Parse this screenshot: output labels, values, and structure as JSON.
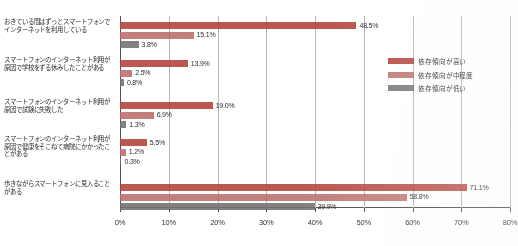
{
  "chart_data": {
    "type": "bar",
    "orientation": "horizontal",
    "title": "",
    "xlabel": "",
    "ylabel": "",
    "xlim": [
      0,
      80
    ],
    "xtick_labels": [
      "0%",
      "10%",
      "20%",
      "30%",
      "40%",
      "50%",
      "60%",
      "70%",
      "80%"
    ],
    "xticks": [
      0,
      10,
      20,
      30,
      40,
      50,
      60,
      70,
      80
    ],
    "grid": true,
    "legend_position": "right",
    "categories": [
      "おきている間はずっとスマートフォンでインターネットを利用している",
      "スマートフォンのインターネット利用が原因で学校をずる休みしたことがある",
      "スマートフォンのインターネット利用が原因で試験に失敗した",
      "スマートフォンのインターネット利用が原因で健康をそこねて病院にかかったことがある",
      "歩きながらスマートフォンに見入ることがある"
    ],
    "series": [
      {
        "name": "依存傾向が高い",
        "color": "#b03a32",
        "values": [
          48.5,
          13.9,
          19.0,
          5.5,
          71.1
        ],
        "labels": [
          "48.5%",
          "13.9%",
          "19.0%",
          "5.5%",
          "71.1%"
        ]
      },
      {
        "name": "依存傾向が中程度",
        "color": "#bc6a66",
        "values": [
          15.1,
          2.5,
          6.9,
          1.2,
          58.8
        ],
        "labels": [
          "15.1%",
          "2.5%",
          "6.9%",
          "1.2%",
          "58.8%"
        ]
      },
      {
        "name": "依存傾向が低い",
        "color": "#6d6d6d",
        "values": [
          3.8,
          0.8,
          1.3,
          0.3,
          39.9
        ],
        "labels": [
          "3.8%",
          "0.8%",
          "1.3%",
          "0.3%",
          "39.9%"
        ]
      }
    ]
  }
}
